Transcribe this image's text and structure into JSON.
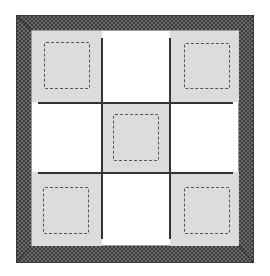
{
  "diagram": {
    "type": "3x3 grid with checkered border frame",
    "colors": {
      "frame_dark": "#3c3c3c",
      "frame_light": "#6a6a6a",
      "shaded_cell": "#ececec",
      "dashed_outline": "#555555",
      "grid_line": "#333333",
      "background": "#ffffff"
    },
    "grid": {
      "rows": 3,
      "cols": 3,
      "cells": [
        {
          "row": 0,
          "col": 0,
          "shaded": true,
          "dashed_square": true
        },
        {
          "row": 0,
          "col": 1,
          "shaded": false,
          "dashed_square": false
        },
        {
          "row": 0,
          "col": 2,
          "shaded": true,
          "dashed_square": true
        },
        {
          "row": 1,
          "col": 0,
          "shaded": false,
          "dashed_square": false
        },
        {
          "row": 1,
          "col": 1,
          "shaded": true,
          "dashed_square": true
        },
        {
          "row": 1,
          "col": 2,
          "shaded": false,
          "dashed_square": false
        },
        {
          "row": 2,
          "col": 0,
          "shaded": true,
          "dashed_square": true
        },
        {
          "row": 2,
          "col": 1,
          "shaded": false,
          "dashed_square": false
        },
        {
          "row": 2,
          "col": 2,
          "shaded": true,
          "dashed_square": true
        }
      ]
    }
  }
}
